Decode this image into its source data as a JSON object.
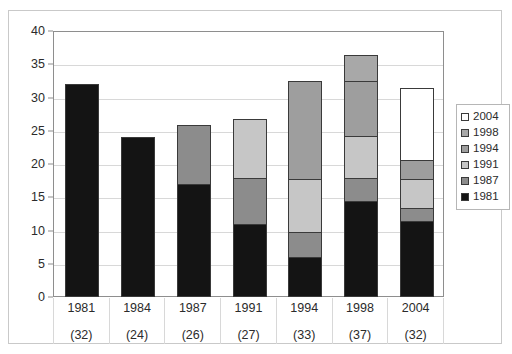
{
  "chart_data": {
    "type": "bar",
    "subtype": "stacked",
    "title": "",
    "xlabel": "",
    "ylabel": "",
    "ylim": [
      0,
      40
    ],
    "yticks": [
      0,
      5,
      10,
      15,
      20,
      25,
      30,
      35,
      40
    ],
    "grid": true,
    "legend_position": "right",
    "categories": [
      "1981",
      "1984",
      "1987",
      "1991",
      "1994",
      "1998",
      "2004"
    ],
    "category_totals": [
      "(32)",
      "(24)",
      "(26)",
      "(27)",
      "(33)",
      "(37)",
      "(32)"
    ],
    "totals": [
      32,
      24,
      26,
      27,
      33,
      37,
      32
    ],
    "series": [
      {
        "name": "1981",
        "color": "#141414",
        "values": [
          32,
          24,
          17,
          11,
          6,
          14.5,
          11.5
        ]
      },
      {
        "name": "1987",
        "color": "#8c8c8c",
        "values": [
          0,
          0,
          9,
          7,
          4,
          3.5,
          2
        ]
      },
      {
        "name": "1991",
        "color": "#c6c6c6",
        "values": [
          0,
          0,
          0,
          9,
          8,
          6.5,
          4.5
        ]
      },
      {
        "name": "1994",
        "color": "#9e9e9e",
        "values": [
          0,
          0,
          0,
          0,
          15,
          8.5,
          3
        ]
      },
      {
        "name": "1998",
        "color": "#a8a8a8",
        "values": [
          0,
          0,
          0,
          0,
          0,
          4,
          0
        ]
      },
      {
        "name": "2004",
        "color": "#ffffff",
        "values": [
          0,
          0,
          0,
          0,
          0,
          0,
          11
        ]
      }
    ]
  },
  "legend": {
    "entries": [
      {
        "label": "2004",
        "color": "#ffffff"
      },
      {
        "label": "1998",
        "color": "#a8a8a8"
      },
      {
        "label": "1994",
        "color": "#9e9e9e"
      },
      {
        "label": "1991",
        "color": "#c6c6c6"
      },
      {
        "label": "1987",
        "color": "#8c8c8c"
      },
      {
        "label": "1981",
        "color": "#141414"
      }
    ]
  },
  "colors": {
    "frame_border": "#c9c9c9",
    "plot_border": "#8e8e8e",
    "gridline": "#d8d8d8",
    "text": "#2b2b2b",
    "segment_outline": "#3a3a3a"
  }
}
